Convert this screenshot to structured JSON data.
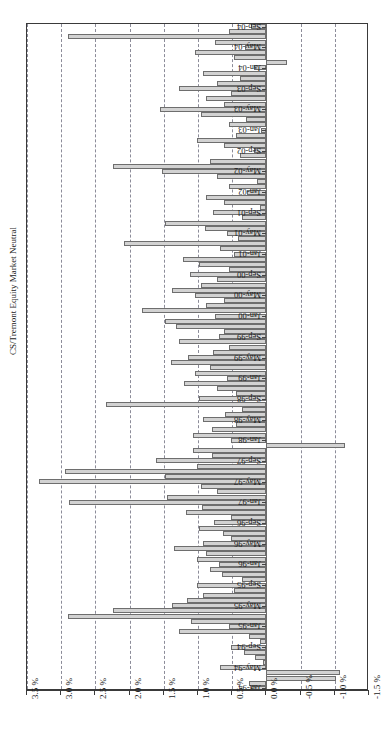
{
  "chart_data": {
    "type": "bar",
    "orientation": "horizontal",
    "title": "CS/Tremont Equity Market Neutral",
    "xlabel": "",
    "ylabel": "CS/Tremont Equity Market Neutral",
    "xlim": [
      3.5,
      -1.5
    ],
    "axis_inverted": true,
    "grid": true,
    "legend": "none",
    "tick_labels": [
      "3.5 %",
      "3.0 %",
      "2.5 %",
      "2.0 %",
      "1.5 %",
      "1.0 %",
      "0.5 %",
      "0.0 %",
      "-0.5 %",
      "-1.0 %",
      "-1.5 %"
    ],
    "tick_values": [
      3.5,
      3.0,
      2.5,
      2.0,
      1.5,
      1.0,
      0.5,
      0.0,
      -0.5,
      -1.0,
      -1.5
    ],
    "units": "percent",
    "labelled_categories": [
      "Sep-04",
      "May-04",
      "Jan-04",
      "Sep-03",
      "May-03",
      "Jan-03",
      "Sep-02",
      "May-02",
      "Jan-02",
      "Sep-01",
      "May-01",
      "Jan-01",
      "Sep-00",
      "May-00",
      "Jan-00",
      "Sep-99",
      "May-99",
      "Jan-99",
      "Sep-98",
      "May-98",
      "Jan-98",
      "Sep-97",
      "May-97",
      "Jan-97",
      "Sep-96",
      "May-96",
      "Jan-96",
      "Sep-95",
      "May-95",
      "Jan-95",
      "Sep-94",
      "May-94",
      "Jan-94"
    ],
    "categories": [
      "Jan-94",
      "Feb-94",
      "Mar-94",
      "Apr-94",
      "May-94",
      "Jun-94",
      "Jul-94",
      "Aug-94",
      "Sep-94",
      "Oct-94",
      "Nov-94",
      "Dec-94",
      "Jan-95",
      "Feb-95",
      "Mar-95",
      "Apr-95",
      "May-95",
      "Jun-95",
      "Jul-95",
      "Aug-95",
      "Sep-95",
      "Oct-95",
      "Nov-95",
      "Dec-95",
      "Jan-96",
      "Feb-96",
      "Mar-96",
      "Apr-96",
      "May-96",
      "Jun-96",
      "Jul-96",
      "Aug-96",
      "Sep-96",
      "Oct-96",
      "Nov-96",
      "Dec-96",
      "Jan-97",
      "Feb-97",
      "Mar-97",
      "Apr-97",
      "May-97",
      "Jun-97",
      "Jul-97",
      "Aug-97",
      "Sep-97",
      "Oct-97",
      "Nov-97",
      "Dec-97",
      "Jan-98",
      "Feb-98",
      "Mar-98",
      "Apr-98",
      "May-98",
      "Jun-98",
      "Jul-98",
      "Aug-98",
      "Sep-98",
      "Oct-98",
      "Nov-98",
      "Dec-98",
      "Jan-99",
      "Feb-99",
      "Mar-99",
      "Apr-99",
      "May-99",
      "Jun-99",
      "Jul-99",
      "Aug-99",
      "Sep-99",
      "Oct-99",
      "Nov-99",
      "Dec-99",
      "Jan-00",
      "Feb-00",
      "Mar-00",
      "Apr-00",
      "May-00",
      "Jun-00",
      "Jul-00",
      "Aug-00",
      "Sep-00",
      "Oct-00",
      "Nov-00",
      "Dec-00",
      "Jan-01",
      "Feb-01",
      "Mar-01",
      "Apr-01",
      "May-01",
      "Jun-01",
      "Jul-01",
      "Aug-01",
      "Sep-01",
      "Oct-01",
      "Nov-01",
      "Dec-01",
      "Jan-02",
      "Feb-02",
      "Mar-02",
      "Apr-02",
      "May-02",
      "Jun-02",
      "Jul-02",
      "Aug-02",
      "Sep-02",
      "Oct-02",
      "Nov-02",
      "Dec-02",
      "Jan-03",
      "Feb-03",
      "Mar-03",
      "Apr-03",
      "May-03",
      "Jun-03",
      "Jul-03",
      "Aug-03",
      "Sep-03",
      "Oct-03",
      "Nov-03",
      "Dec-03",
      "Jan-04",
      "Feb-04",
      "Mar-04",
      "Apr-04",
      "May-04",
      "Jun-04",
      "Jul-04",
      "Aug-04",
      "Sep-04"
    ],
    "values": [
      0.22,
      0.25,
      -1.02,
      -1.08,
      0.68,
      0.05,
      0.17,
      0.33,
      0.52,
      0.1,
      0.26,
      1.28,
      0.55,
      1.1,
      2.9,
      2.25,
      1.38,
      1.16,
      0.92,
      0.48,
      1.02,
      0.35,
      0.65,
      0.83,
      0.7,
      1.02,
      0.88,
      1.35,
      0.92,
      0.52,
      0.64,
      0.98,
      0.76,
      0.52,
      1.18,
      0.94,
      2.88,
      1.45,
      0.72,
      0.95,
      3.32,
      1.48,
      2.95,
      1.02,
      1.62,
      0.8,
      1.08,
      -1.15,
      0.52,
      1.08,
      0.8,
      0.45,
      0.92,
      0.6,
      0.35,
      2.35,
      0.98,
      0.45,
      0.72,
      1.2,
      0.58,
      1.05,
      0.82,
      1.4,
      1.15,
      0.78,
      0.55,
      1.28,
      0.7,
      0.62,
      1.32,
      1.48,
      0.75,
      1.82,
      0.88,
      0.62,
      1.05,
      1.38,
      0.95,
      0.72,
      1.12,
      0.55,
      0.98,
      1.22,
      0.48,
      0.68,
      2.08,
      0.42,
      0.58,
      0.9,
      1.48,
      0.35,
      0.78,
      0.1,
      0.62,
      0.88,
      0.28,
      0.55,
      0.14,
      0.72,
      1.52,
      2.25,
      0.82,
      0.38,
      0.18,
      0.62,
      1.02,
      0.45,
      0.08,
      0.55,
      0.3,
      0.95,
      1.55,
      0.62,
      0.88,
      0.52,
      1.28,
      0.72,
      0.38,
      0.92,
      0.18,
      -0.3,
      0.48,
      1.05,
      0.32,
      0.75,
      2.9,
      0.55,
      0.22
    ]
  }
}
